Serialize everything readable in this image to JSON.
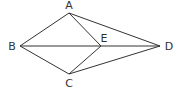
{
  "diagram": {
    "type": "geometry-figure",
    "points": [
      {
        "id": "A",
        "label": "A",
        "x": 69,
        "y": 13,
        "lx": 69,
        "ly": 9
      },
      {
        "id": "B",
        "label": "B",
        "x": 20,
        "y": 46,
        "lx": 12,
        "ly": 50
      },
      {
        "id": "C",
        "label": "C",
        "x": 69,
        "y": 74,
        "lx": 69,
        "ly": 87
      },
      {
        "id": "D",
        "label": "D",
        "x": 160,
        "y": 46,
        "lx": 169,
        "ly": 50
      },
      {
        "id": "E",
        "label": "E",
        "x": 101,
        "y": 46,
        "lx": 104,
        "ly": 42
      }
    ],
    "edges": [
      [
        "A",
        "B"
      ],
      [
        "A",
        "E"
      ],
      [
        "A",
        "D"
      ],
      [
        "B",
        "E"
      ],
      [
        "E",
        "D"
      ],
      [
        "B",
        "C"
      ],
      [
        "C",
        "E"
      ],
      [
        "C",
        "D"
      ]
    ],
    "colors": {
      "stroke": "#333333",
      "label": "#333333",
      "background": "#ffffff"
    }
  }
}
